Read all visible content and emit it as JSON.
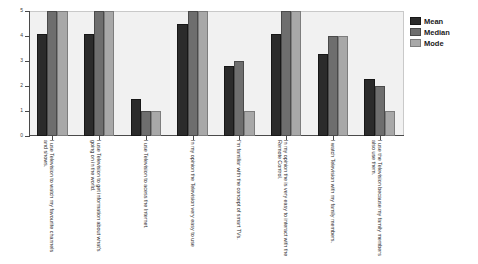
{
  "chart_data": {
    "type": "bar",
    "title": "",
    "subtitle": "",
    "xlabel": "",
    "ylabel": "",
    "ylim": [
      0,
      5
    ],
    "yticks": [
      0,
      1,
      2,
      3,
      4,
      5
    ],
    "grid": false,
    "legend_position": "right",
    "categories": [
      "I use Television to watch my favourite channels and shows.",
      "I use Television to get information about what's going on in the world.",
      "I use Television to acess the Internet.",
      "In my opinion the Television very easy to use",
      "I'm familiar with the concept of smart TVs.",
      "In my opinion the is very easy to interact with the Remote Control.",
      "I watch Television with my family members.",
      "I use the Television because my family members also use them."
    ],
    "series": [
      {
        "name": "Mean",
        "color": "#2b2b2b",
        "values": [
          4.1,
          4.1,
          1.5,
          4.5,
          2.8,
          4.1,
          3.3,
          2.3
        ]
      },
      {
        "name": "Median",
        "color": "#6e6e6e",
        "values": [
          5,
          5,
          1,
          5,
          3,
          5,
          4,
          2
        ]
      },
      {
        "name": "Mode",
        "color": "#a8a8a8",
        "values": [
          5,
          5,
          1,
          5,
          1,
          5,
          4,
          1
        ]
      }
    ]
  },
  "legend": {
    "items": [
      {
        "label": "Mean"
      },
      {
        "label": "Median"
      },
      {
        "label": "Mode"
      }
    ]
  },
  "axis": {
    "y_tick_labels": [
      "0",
      "1",
      "2",
      "3",
      "4",
      "5"
    ]
  }
}
